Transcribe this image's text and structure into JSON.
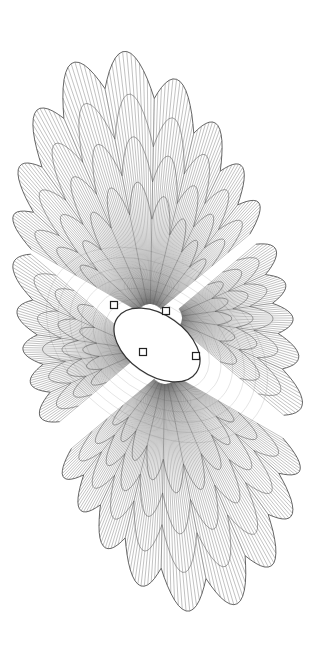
{
  "figure": {
    "background": "#ffffff",
    "stroke": "#555555",
    "bounds": {
      "x": [
        22,
        293
      ],
      "y": [
        45,
        618
      ]
    },
    "center_opening": {
      "cx": 157,
      "cy": 345,
      "rx": 48,
      "ry": 30,
      "rotation": 35
    },
    "nodes": [
      {
        "x": 114,
        "y": 305
      },
      {
        "x": 166,
        "y": 311
      },
      {
        "x": 143,
        "y": 352
      },
      {
        "x": 196,
        "y": 356
      }
    ],
    "fans": [
      {
        "name": "top-fan",
        "origin": [
          150,
          318
        ],
        "angle_start": -150,
        "angle_end": -40,
        "radius": 270,
        "petals": 9
      },
      {
        "name": "right-fan",
        "origin": [
          168,
          318
        ],
        "angle_start": -40,
        "angle_end": 40,
        "radius": 130,
        "petals": 5
      },
      {
        "name": "bottom-fan",
        "origin": [
          165,
          370
        ],
        "angle_start": 30,
        "angle_end": 140,
        "radius": 270,
        "petals": 9
      },
      {
        "name": "left-fan",
        "origin": [
          145,
          350
        ],
        "angle_start": 140,
        "angle_end": 220,
        "radius": 130,
        "petals": 5
      }
    ]
  }
}
